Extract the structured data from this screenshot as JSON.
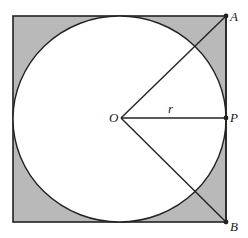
{
  "diagram": {
    "type": "geometry",
    "colors": {
      "shade": "#b9b9b9",
      "stroke": "#222222",
      "background": "#ffffff"
    },
    "square": {
      "x": 13,
      "y": 16,
      "size": 213
    },
    "circle": {
      "cx": 120,
      "cy": 118,
      "r": 105
    },
    "points": {
      "O": {
        "label": "O",
        "x": 120,
        "y": 118
      },
      "A": {
        "label": "A",
        "x": 226,
        "y": 16
      },
      "P": {
        "label": "P",
        "x": 226,
        "y": 118
      },
      "B": {
        "label": "B",
        "x": 226,
        "y": 222
      }
    },
    "segments": [
      {
        "from": "O",
        "to": "A"
      },
      {
        "from": "O",
        "to": "P",
        "label": "r"
      },
      {
        "from": "O",
        "to": "B"
      }
    ],
    "labels": {
      "O": "O",
      "A": "A",
      "P": "P",
      "B": "B",
      "r": "r"
    }
  }
}
